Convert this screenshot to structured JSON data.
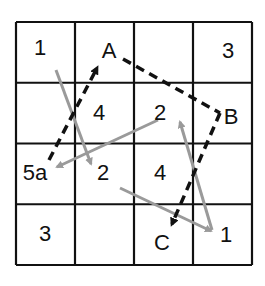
{
  "grid": {
    "rows": 4,
    "cols": 4,
    "origin": [
      16,
      22
    ],
    "size": [
      236,
      243
    ],
    "line_color": "#111111",
    "cells": [
      [
        "1",
        "",
        "",
        "3"
      ],
      [
        "",
        "4",
        "2",
        ""
      ],
      [
        "5a",
        "2",
        "4",
        ""
      ],
      [
        "3",
        "",
        "",
        "1"
      ]
    ]
  },
  "labels": [
    {
      "id": "cell-1-top-left",
      "text": "1",
      "x": 40,
      "y": 55
    },
    {
      "id": "point-A",
      "text": "A",
      "x": 109,
      "y": 58
    },
    {
      "id": "cell-3-top-right",
      "text": "3",
      "x": 228,
      "y": 58
    },
    {
      "id": "cell-4-r2c2",
      "text": "4",
      "x": 99,
      "y": 120
    },
    {
      "id": "cell-2-r2c3",
      "text": "2",
      "x": 160,
      "y": 120
    },
    {
      "id": "point-B",
      "text": "B",
      "x": 231,
      "y": 124
    },
    {
      "id": "cell-5a",
      "text": "5a",
      "x": 35,
      "y": 180
    },
    {
      "id": "cell-2-r3c2",
      "text": "2",
      "x": 103,
      "y": 180
    },
    {
      "id": "cell-4-r3c3",
      "text": "4",
      "x": 160,
      "y": 180
    },
    {
      "id": "cell-3-bottom-left",
      "text": "3",
      "x": 45,
      "y": 241
    },
    {
      "id": "point-C",
      "text": "C",
      "x": 162,
      "y": 250
    },
    {
      "id": "cell-1-bottom-right",
      "text": "1",
      "x": 226,
      "y": 242
    }
  ],
  "gray_arrows": {
    "color": "#9a9a9a",
    "items": [
      {
        "from": [
          56,
          70
        ],
        "to": [
          91,
          164
        ]
      },
      {
        "from": [
          158,
          120
        ],
        "to": [
          57,
          167
        ]
      },
      {
        "from": [
          120,
          188
        ],
        "to": [
          211,
          231
        ]
      },
      {
        "from": [
          212,
          230
        ],
        "to": [
          180,
          122
        ]
      }
    ]
  },
  "dashed_path": {
    "color": "#111111",
    "segments": [
      {
        "from": [
          49,
          160
        ],
        "to": [
          97,
          68
        ],
        "arrow": true
      },
      {
        "from": [
          123,
          59
        ],
        "to": [
          220,
          113
        ],
        "arrow": false
      },
      {
        "from": [
          220,
          113
        ],
        "to": [
          172,
          224
        ],
        "arrow": true
      }
    ]
  }
}
